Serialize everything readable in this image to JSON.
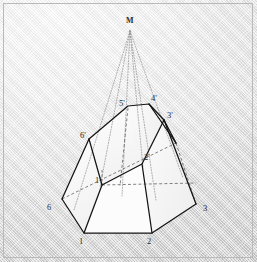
{
  "figure": {
    "background_color": "#e2e2e2",
    "border_color": "#b9b9b9",
    "stroke_color": "#1a1a1a",
    "hidden_stroke_color": "#555555",
    "projector_color": "#8a8a8a",
    "face_fill": "#fbfbfb",
    "labels": [
      {
        "id": "M",
        "text": "M",
        "x": 126,
        "y": 18,
        "bold": true
      },
      {
        "id": "5p",
        "text": "5'",
        "x": 120,
        "y": 100,
        "bold": false
      },
      {
        "id": "4p",
        "text": "4'",
        "x": 152,
        "y": 96,
        "bold": false
      },
      {
        "id": "3p",
        "text": "3'",
        "x": 168,
        "y": 113,
        "bold": false
      },
      {
        "id": "6p",
        "text": "6'",
        "x": 81,
        "y": 133,
        "bold": false
      },
      {
        "id": "2p",
        "text": "2'",
        "x": 145,
        "y": 155,
        "bold": false
      },
      {
        "id": "1p",
        "text": "1'",
        "x": 95,
        "y": 176,
        "bold": false
      },
      {
        "id": "6",
        "text": "6",
        "x": 47,
        "y": 205,
        "bold": false
      },
      {
        "id": "3",
        "text": "3",
        "x": 203,
        "y": 206,
        "bold": false
      },
      {
        "id": "1",
        "text": "1",
        "x": 79,
        "y": 238,
        "bold": false
      },
      {
        "id": "2",
        "text": "2",
        "x": 147,
        "y": 238,
        "bold": false
      }
    ],
    "vertices": {
      "M": [
        130,
        27
      ],
      "1": [
        84,
        233
      ],
      "2": [
        152,
        233
      ],
      "3": [
        196,
        204
      ],
      "4": [
        176,
        143
      ],
      "5": [
        131,
        119
      ],
      "6": [
        62,
        199
      ],
      "1p": [
        102,
        185
      ],
      "2p": [
        142,
        164
      ],
      "3p": [
        164,
        120
      ],
      "4p": [
        149,
        104
      ],
      "5p": [
        128,
        106
      ],
      "6p": [
        89,
        139
      ]
    },
    "solid_edges": [
      [
        "1",
        "2"
      ],
      [
        "2",
        "3"
      ],
      [
        "3",
        "4"
      ],
      [
        "6",
        "1"
      ],
      [
        "6p",
        "6"
      ],
      [
        "1p",
        "1"
      ],
      [
        "2p",
        "2"
      ],
      [
        "3p",
        "3"
      ],
      [
        "6p",
        "5p"
      ],
      [
        "5p",
        "4p"
      ],
      [
        "4p",
        "3p"
      ],
      [
        "6p",
        "1p"
      ],
      [
        "1p",
        "2p"
      ],
      [
        "2p",
        "3p"
      ]
    ],
    "hidden_edges": [
      [
        "6",
        "2p_base_left"
      ],
      [
        "1p",
        "hz_right"
      ],
      [
        "5p",
        "1p_v"
      ],
      [
        "4p",
        "2p_v"
      ],
      [
        "3p",
        "2p_h"
      ]
    ],
    "projector_targets": [
      "6p",
      "5p",
      "4p",
      "3p",
      "1p",
      "2p"
    ]
  }
}
